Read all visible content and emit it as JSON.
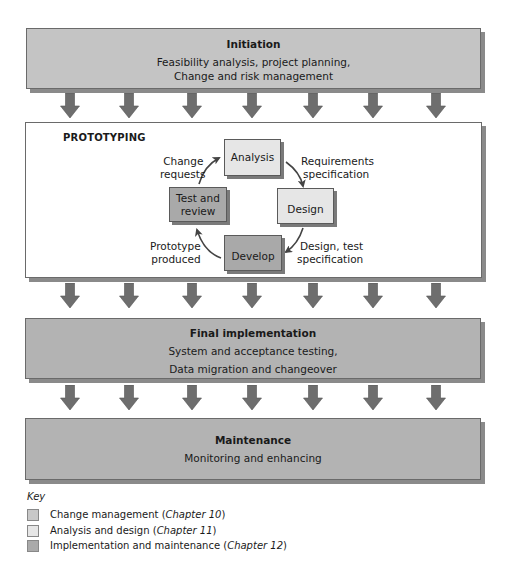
{
  "phases": {
    "initiation": {
      "title": "Initiation",
      "lines": [
        "Feasibility analysis, project planning,",
        "Change and risk management"
      ]
    },
    "prototyping": {
      "title": "PROTOTYPING",
      "nodes": {
        "analysis": "Analysis",
        "design": "Design",
        "develop": "Develop",
        "test_review": [
          "Test and",
          "review"
        ]
      },
      "transitions": {
        "analysis_to_design": [
          "Requirements",
          "specification"
        ],
        "design_to_develop": [
          "Design, test",
          "specification"
        ],
        "develop_to_test": [
          "Prototype",
          "produced"
        ],
        "test_to_analysis": [
          "Change",
          "requests"
        ]
      }
    },
    "final_implementation": {
      "title": "Final implementation",
      "lines": [
        "System and acceptance testing,",
        "Data migration and changeover"
      ]
    },
    "maintenance": {
      "title": "Maintenance",
      "lines": [
        "Monitoring and enhancing"
      ]
    }
  },
  "arrows": {
    "count_per_row": 7,
    "x_centers": [
      70,
      129,
      192,
      252,
      313,
      373,
      436
    ],
    "color": "#6e6e6e"
  },
  "key": {
    "title": "Key",
    "items": [
      {
        "label": "Change management (",
        "chapter": "Chapter 10",
        "close": ")",
        "color": "#c8c8c8"
      },
      {
        "label": "Analysis and design (",
        "chapter": "Chapter 11",
        "close": ")",
        "color": "#e6e6e6"
      },
      {
        "label": "Implementation and maintenance (",
        "chapter": "Chapter 12",
        "close": ")",
        "color": "#aaaaaa"
      }
    ]
  }
}
